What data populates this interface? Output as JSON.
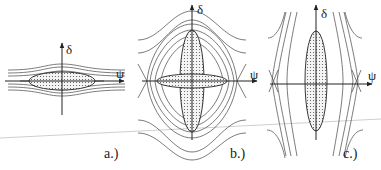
{
  "figure": {
    "panels": [
      {
        "id": "a",
        "label": "a.)",
        "x_axis_label": "ψ",
        "y_axis_label": "δ",
        "description": "thin horizontal dotted ellipse with nearly flat trajectories"
      },
      {
        "id": "b",
        "label": "b.)",
        "x_axis_label": "ψ",
        "y_axis_label": "δ",
        "description": "horizontal and vertical dotted ellipses crossing inside separatrix with X-points"
      },
      {
        "id": "c",
        "label": "c.)",
        "x_axis_label": "ψ",
        "y_axis_label": "δ",
        "description": "tall vertical dotted ellipse with open trajectories"
      }
    ],
    "colors": {
      "line": "#333333",
      "fill_dots": "#555555",
      "scan_line": "#c8c8c8"
    }
  }
}
